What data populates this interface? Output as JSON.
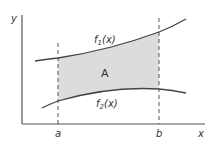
{
  "diagram": {
    "axes": {
      "x_label": "x",
      "y_label": "y"
    },
    "bounds": {
      "a_label": "a",
      "b_label": "b"
    },
    "curves": {
      "upper": {
        "label_base": "f",
        "label_sub": "1",
        "label_arg": "(x)"
      },
      "lower": {
        "label_base": "f",
        "label_sub": "2",
        "label_arg": "(x)"
      }
    },
    "region": {
      "label": "A",
      "fill": "#dcdcdc"
    },
    "colors": {
      "stroke": "#444444",
      "axis": "#555555",
      "text": "#333333",
      "shade": "#dcdcdc"
    }
  }
}
